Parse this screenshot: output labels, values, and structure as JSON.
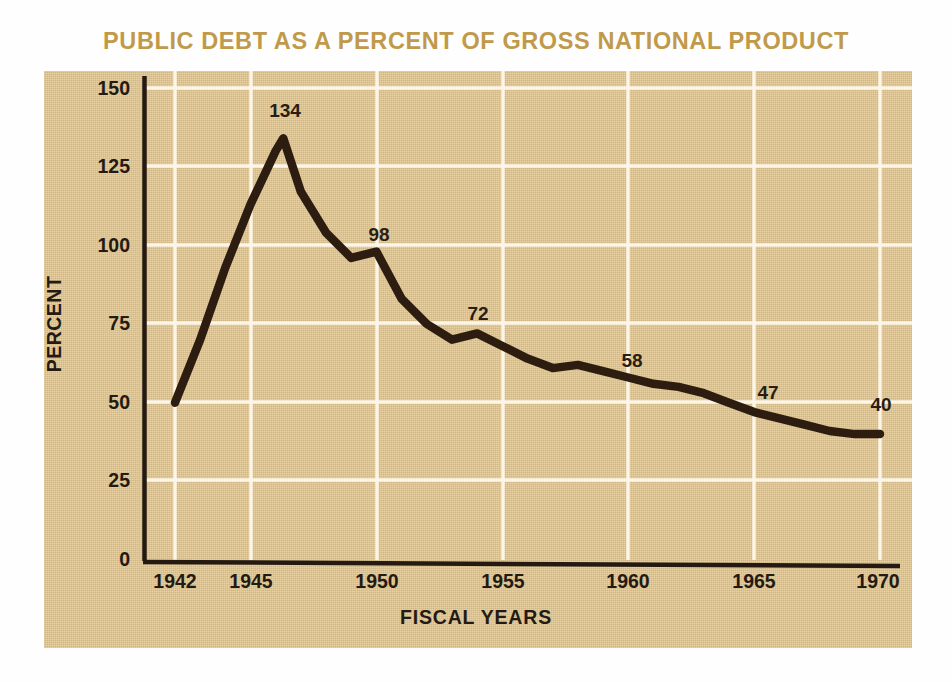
{
  "title": "PUBLIC DEBT AS A PERCENT OF GROSS NATIONAL PRODUCT",
  "colors": {
    "title": "#c09a4a",
    "panel_background": "#e0c48d",
    "gridline": "#fdf6e8",
    "axis": "#241a12",
    "line": "#2c1d10",
    "text": "#241a12"
  },
  "axes": {
    "y_title": "PERCENT",
    "x_title": "FISCAL YEARS",
    "y_ticks": [
      "150",
      "125",
      "100",
      "75",
      "50",
      "25",
      "0"
    ],
    "x_ticks": [
      "1942",
      "1945",
      "1950",
      "1955",
      "1960",
      "1965",
      "1970"
    ]
  },
  "chart_data": {
    "type": "line",
    "title": "PUBLIC DEBT AS A PERCENT OF GROSS NATIONAL PRODUCT",
    "xlabel": "FISCAL YEARS",
    "ylabel": "PERCENT",
    "xlim": [
      1942,
      1971
    ],
    "ylim": [
      0,
      150
    ],
    "yticks": [
      0,
      25,
      50,
      75,
      100,
      125,
      150
    ],
    "xticks": [
      1942,
      1945,
      1950,
      1955,
      1960,
      1965,
      1970
    ],
    "grid": true,
    "legend": "none",
    "x": [
      1942,
      1943,
      1944,
      1945,
      1946,
      1946.3,
      1947,
      1948,
      1949,
      1950,
      1951,
      1952,
      1953,
      1954,
      1955,
      1956,
      1957,
      1958,
      1959,
      1960,
      1961,
      1962,
      1963,
      1964,
      1965,
      1966,
      1967,
      1968,
      1969,
      1970
    ],
    "values": [
      50,
      70,
      93,
      113,
      130,
      134,
      117,
      104,
      96,
      98,
      83,
      75,
      70,
      72,
      68,
      64,
      61,
      62,
      60,
      58,
      56,
      55,
      53,
      50,
      47,
      45,
      43,
      41,
      40,
      40
    ],
    "annotations": [
      {
        "label": "134",
        "x": 1946.3,
        "y": 134
      },
      {
        "label": "98",
        "x": 1950,
        "y": 98
      },
      {
        "label": "72",
        "x": 1954,
        "y": 72
      },
      {
        "label": "58",
        "x": 1960,
        "y": 58
      },
      {
        "label": "47",
        "x": 1965,
        "y": 47
      },
      {
        "label": "40",
        "x": 1970,
        "y": 40
      }
    ]
  }
}
